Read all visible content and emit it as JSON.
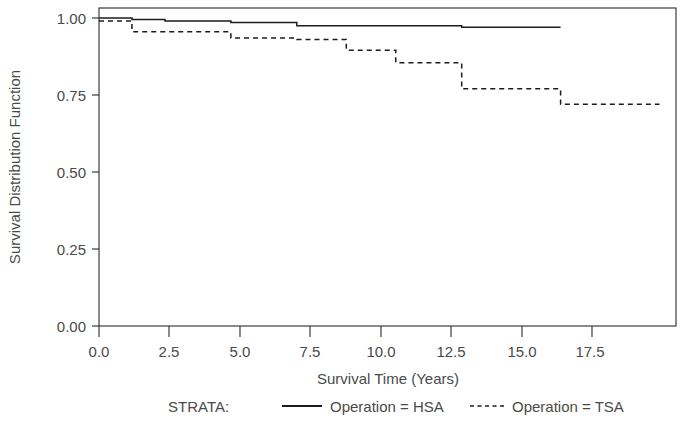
{
  "chart_data": {
    "type": "line",
    "subtype": "kaplan-meier-step",
    "title": "",
    "xlabel": "Survival Time (Years)",
    "ylabel": "Survival Distribution Function",
    "xlim": [
      0.0,
      17.5
    ],
    "ylim": [
      0.0,
      1.0
    ],
    "xticks": [
      0.0,
      2.5,
      5.0,
      7.5,
      10.0,
      12.5,
      15.0,
      17.5
    ],
    "xticklabels": [
      "0.0",
      "2.5",
      "5.0",
      "7.5",
      "10.0",
      "12.5",
      "15.0",
      "17.5"
    ],
    "yticks": [
      0.0,
      0.25,
      0.5,
      0.75,
      1.0
    ],
    "yticklabels": [
      "0.00",
      "0.25",
      "0.50",
      "0.75",
      "1.00"
    ],
    "grid": false,
    "legend_position": "below",
    "legend_prefix": "STRATA:",
    "series": [
      {
        "name": "Operation = HSA",
        "style": "solid",
        "color": "#1c1c1c",
        "x": [
          0.0,
          1.0,
          1.0,
          2.0,
          2.0,
          4.0,
          4.0,
          6.0,
          6.0,
          11.0,
          11.0,
          14.0
        ],
        "y": [
          1.0,
          1.0,
          0.995,
          0.995,
          0.99,
          0.99,
          0.985,
          0.985,
          0.975,
          0.975,
          0.97,
          0.97
        ]
      },
      {
        "name": "Operation = TSA",
        "style": "dashed",
        "color": "#1c1c1c",
        "x": [
          0.0,
          1.0,
          1.0,
          4.0,
          4.0,
          6.0,
          6.0,
          7.5,
          7.5,
          9.0,
          9.0,
          11.0,
          11.0,
          14.0,
          14.0,
          17.0
        ],
        "y": [
          0.99,
          0.99,
          0.955,
          0.955,
          0.935,
          0.935,
          0.93,
          0.93,
          0.895,
          0.895,
          0.855,
          0.855,
          0.77,
          0.77,
          0.72,
          0.72
        ]
      }
    ]
  },
  "legend": {
    "prefix": "STRATA:",
    "entries": [
      {
        "label": "Operation = HSA",
        "style": "solid"
      },
      {
        "label": "Operation = TSA",
        "style": "dashed"
      }
    ]
  },
  "axes": {
    "x_title": "Survival Time (Years)",
    "y_title": "Survival Distribution Function",
    "x_tick_labels": [
      "0.0",
      "2.5",
      "5.0",
      "7.5",
      "10.0",
      "12.5",
      "15.0",
      "17.5"
    ],
    "y_tick_labels": [
      "0.00",
      "0.25",
      "0.50",
      "0.75",
      "1.00"
    ]
  }
}
